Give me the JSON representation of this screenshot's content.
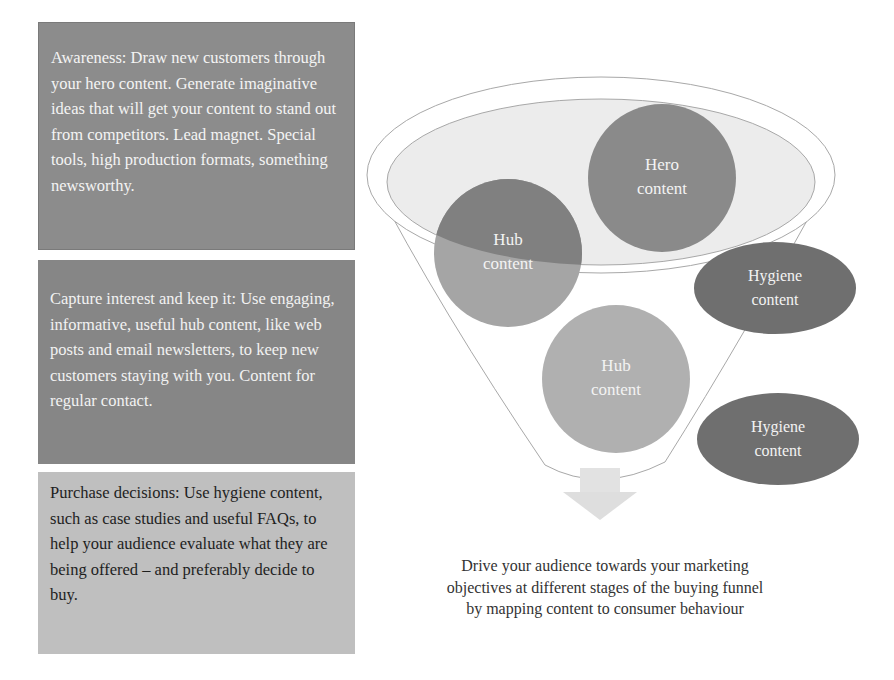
{
  "left_panel": {
    "boxes": [
      {
        "stage": "Awareness",
        "text": "Awareness: Draw new customers through your hero content. Generate imaginative ideas that will get your content to stand out from competitors. Lead magnet. Special tools, high production formats, something newsworthy.",
        "color": "#8c8c8c"
      },
      {
        "stage": "Interest",
        "text": "Capture interest and keep it: Use engaging, informative, useful hub content, like web posts and email newsletters, to keep new customers staying with you. Content for regular contact.",
        "color": "#868686"
      },
      {
        "stage": "Purchase",
        "text": "Purchase decisions: Use hygiene content, such as case studies and useful FAQs, to help your audience evaluate what they are being offered – and preferably decide to buy.",
        "color": "#bfbfbf"
      }
    ]
  },
  "funnel": {
    "nodes": [
      {
        "id": "hero",
        "line1": "Hero",
        "line2": "content",
        "color": "#8a8a8a"
      },
      {
        "id": "hub-top",
        "line1": "Hub",
        "line2": "content",
        "color": "#a5a5a5"
      },
      {
        "id": "hub-bottom",
        "line1": "Hub",
        "line2": "content",
        "color": "#b0b0b0"
      },
      {
        "id": "hygiene-1",
        "line1": "Hygiene",
        "line2": "content",
        "color": "#6f6f6f"
      },
      {
        "id": "hygiene-2",
        "line1": "Hygiene",
        "line2": "content",
        "color": "#6f6f6f"
      }
    ],
    "arrow": "down-arrow"
  },
  "caption": {
    "line1": "Drive your audience towards your marketing",
    "line2": "objectives at different stages of the buying funnel",
    "line3": "by mapping content to consumer behaviour"
  }
}
